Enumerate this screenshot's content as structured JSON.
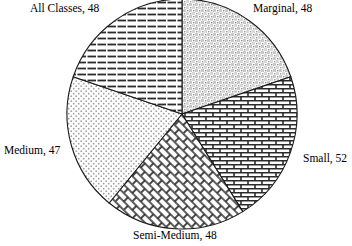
{
  "chart_data": {
    "type": "pie",
    "title": "",
    "xlabel": "",
    "ylabel": "",
    "legend_position": "none",
    "grid": false,
    "total": 243,
    "start_angle_deg": 0,
    "direction": "clockwise",
    "categories": [
      "Marginal",
      "Small",
      "Semi-Medium",
      "Medium",
      "All Classes"
    ],
    "values": [
      48,
      52,
      48,
      47,
      48
    ],
    "slices": [
      {
        "name": "Marginal",
        "value": 48,
        "label": "Marginal, 48",
        "pattern": "fine-speckle",
        "start_deg": 0,
        "end_deg": 71.1,
        "label_position": "top-right"
      },
      {
        "name": "Small",
        "value": 52,
        "label": "Small, 52",
        "pattern": "brick",
        "start_deg": 71.1,
        "end_deg": 148.1,
        "label_position": "right"
      },
      {
        "name": "Semi-Medium",
        "value": 48,
        "label": "Semi-Medium, 48",
        "pattern": "diagonal-basketweave",
        "start_deg": 148.1,
        "end_deg": 219.3,
        "label_position": "bottom"
      },
      {
        "name": "Medium",
        "value": 47,
        "label": "Medium, 47",
        "pattern": "sparse-dots",
        "start_deg": 219.3,
        "end_deg": 288.9,
        "label_position": "left"
      },
      {
        "name": "All Classes",
        "value": 48,
        "label": "All Classes, 48",
        "pattern": "horizontal-dashes",
        "start_deg": 288.9,
        "end_deg": 360,
        "label_position": "top-left"
      }
    ]
  },
  "labels": {
    "all_classes": "All Classes, 48",
    "marginal": "Marginal, 48",
    "small": "Small, 52",
    "semi_medium": "Semi-Medium, 48",
    "medium": "Medium, 47"
  },
  "colors": {
    "background": "#ffffff",
    "outline": "#1a1a1a",
    "pattern_ink": "#2b2b2b",
    "text": "#000000"
  }
}
